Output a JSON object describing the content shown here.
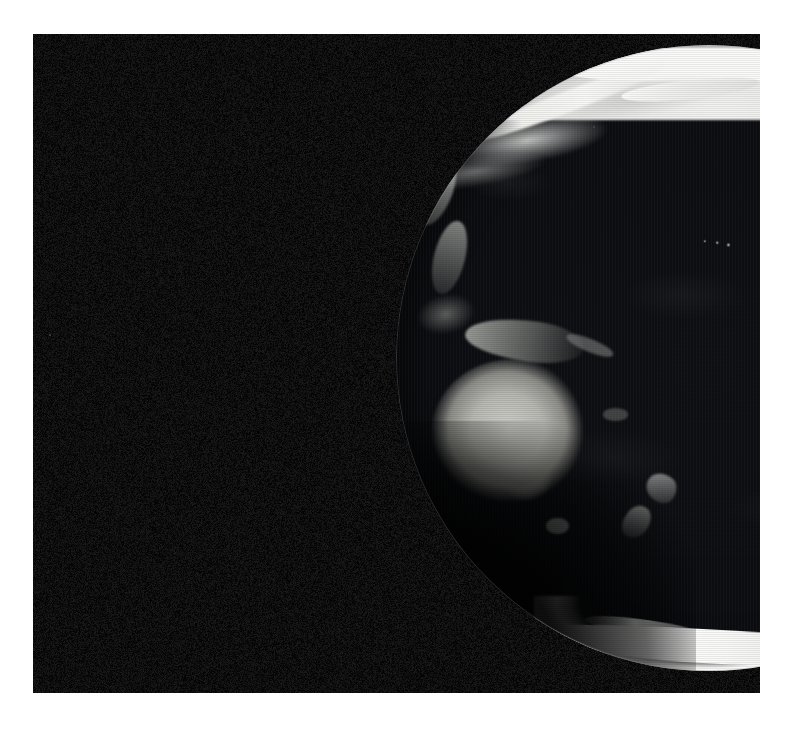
{
  "image": {
    "kind": "satellite-globe-photo",
    "title": "Full-disc grayscale satellite view of Earth centred on the Pacific Ocean",
    "color_mode": "grayscale",
    "background_color": "#ffffff",
    "plate_color": "#010101",
    "highlight_color": "#fbfbf9",
    "land_color": "#b8b8b2",
    "ocean_color": "#080a0e",
    "plate": {
      "x": 33,
      "y": 34,
      "width": 727,
      "height": 659
    },
    "globe": {
      "center_x": 395,
      "center_y": 358,
      "radius": 313
    }
  },
  "features": [
    {
      "id": "arctic-ice-cap",
      "label": "Arctic ice cap",
      "brightness": "very-bright"
    },
    {
      "id": "siberia",
      "label": "North-eastern Siberia",
      "brightness": "bright"
    },
    {
      "id": "kamchatka",
      "label": "Kamchatka Peninsula",
      "brightness": "bright"
    },
    {
      "id": "japan",
      "label": "Japan",
      "brightness": "medium"
    },
    {
      "id": "philippines",
      "label": "Philippines",
      "brightness": "medium"
    },
    {
      "id": "borneo",
      "label": "Borneo",
      "brightness": "medium"
    },
    {
      "id": "new-guinea",
      "label": "New Guinea",
      "brightness": "medium"
    },
    {
      "id": "solomon-islands",
      "label": "Solomon Islands",
      "brightness": "dim"
    },
    {
      "id": "australia",
      "label": "Australia",
      "brightness": "bright"
    },
    {
      "id": "tasmania",
      "label": "Tasmania",
      "brightness": "medium"
    },
    {
      "id": "new-zealand-north",
      "label": "New Zealand — North Island",
      "brightness": "dim"
    },
    {
      "id": "new-zealand-south",
      "label": "New Zealand — South Island",
      "brightness": "dim"
    },
    {
      "id": "fiji",
      "label": "Fiji",
      "brightness": "dim"
    },
    {
      "id": "hawaii",
      "label": "Hawaiian Islands",
      "brightness": "dim"
    },
    {
      "id": "alaska",
      "label": "Alaska",
      "brightness": "bright"
    },
    {
      "id": "north-america",
      "label": "Western North America",
      "brightness": "medium"
    },
    {
      "id": "rocky-mountains",
      "label": "Rocky Mountains",
      "brightness": "bright"
    },
    {
      "id": "central-america",
      "label": "Central America",
      "brightness": "medium"
    },
    {
      "id": "antarctica",
      "label": "Antarctica",
      "brightness": "very-bright"
    },
    {
      "id": "pacific-ocean",
      "label": "Pacific Ocean",
      "brightness": "dark"
    }
  ]
}
